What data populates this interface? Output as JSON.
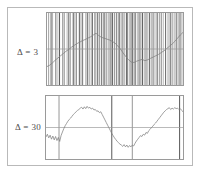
{
  "figure": {
    "title": "",
    "background_color": "#ffffff",
    "frame_color": "#b9b9b9",
    "axis_color": "#9a9a9a"
  },
  "panels": [
    {
      "id": "panel-delta-3",
      "label": "Δ = 3",
      "label_color": "#4c4c4c",
      "spike_color": "#8c8c8c",
      "curve_color": "#8a8a8a",
      "midline_color": "#9a9a9a"
    },
    {
      "id": "panel-delta-30",
      "label": "Δ = 30",
      "label_color": "#4c4c4c",
      "spike_color": "#8c8c8c",
      "curve_color": "#8a8a8a",
      "midline_color": "#9a9a9a"
    }
  ],
  "chart_data": [
    {
      "type": "line",
      "id": "panel-delta-3",
      "title": "Δ = 3",
      "xlabel": "",
      "ylabel": "",
      "xlim": [
        0,
        100
      ],
      "ylim": [
        -1.6,
        1.6
      ],
      "grid": false,
      "legend": "none",
      "midline_y": 0,
      "annotations": [
        "Δ = 3"
      ],
      "series": [
        {
          "name": "smooth-signal",
          "x": [
            0,
            2,
            4,
            6,
            8,
            10,
            12,
            14,
            16,
            18,
            20,
            22,
            24,
            26,
            28,
            30,
            32,
            34,
            36,
            38,
            40,
            42,
            44,
            46,
            48,
            50,
            52,
            54,
            56,
            58,
            60,
            62,
            64,
            66,
            68,
            70,
            72,
            74,
            76,
            78,
            80,
            82,
            84,
            86,
            88,
            90,
            92,
            94,
            96,
            98,
            100
          ],
          "values": [
            -0.78,
            -0.72,
            -0.62,
            -0.5,
            -0.4,
            -0.3,
            -0.2,
            -0.1,
            -0.02,
            0.08,
            0.16,
            0.24,
            0.3,
            0.37,
            0.42,
            0.48,
            0.54,
            0.62,
            0.7,
            0.6,
            0.52,
            0.48,
            0.44,
            0.4,
            0.34,
            0.26,
            0.14,
            0.0,
            -0.18,
            -0.34,
            -0.48,
            -0.58,
            -0.6,
            -0.54,
            -0.5,
            -0.46,
            -0.52,
            -0.48,
            -0.42,
            -0.36,
            -0.3,
            -0.24,
            -0.16,
            -0.08,
            0.02,
            0.12,
            0.22,
            0.34,
            0.48,
            0.62,
            0.74
          ]
        },
        {
          "name": "spike-train",
          "note": "dense vertical impulses spanning full panel height",
          "x": [
            1.2,
            3.0,
            4.1,
            6.5,
            8.0,
            9.2,
            11.4,
            12.6,
            14.8,
            16.0,
            17.1,
            19.3,
            20.5,
            21.6,
            23.8,
            25.0,
            26.2,
            28.4,
            29.6,
            31.0,
            32.5,
            33.4,
            35.2,
            36.0,
            37.3,
            38.6,
            40.0,
            41.2,
            42.0,
            43.5,
            45.0,
            46.4,
            47.5,
            48.2,
            49.6,
            51.0,
            52.3,
            53.1,
            54.5,
            55.8,
            57.0,
            58.4,
            59.2,
            60.5,
            61.8,
            63.0,
            64.2,
            65.0,
            66.4,
            67.7,
            69.0,
            70.2,
            71.5,
            72.8,
            74.0,
            75.3,
            76.6,
            78.0,
            79.4,
            81.0,
            82.6,
            84.0,
            85.5,
            87.2,
            89.0,
            90.6,
            92.0,
            93.5,
            95.0,
            96.4,
            97.8,
            99.2
          ],
          "intensities": [
            0.55,
            0.9,
            0.45,
            0.8,
            0.35,
            0.95,
            0.5,
            0.75,
            0.4,
            0.85,
            0.6,
            0.95,
            0.45,
            0.7,
            0.9,
            0.5,
            0.8,
            0.35,
            0.95,
            0.6,
            0.45,
            0.85,
            0.75,
            0.4,
            0.9,
            0.55,
            0.8,
            0.35,
            0.95,
            0.7,
            0.5,
            0.85,
            0.45,
            0.9,
            0.6,
            0.75,
            0.4,
            0.95,
            0.55,
            0.8,
            0.35,
            0.9,
            0.65,
            0.45,
            0.85,
            0.95,
            0.5,
            0.7,
            0.4,
            0.88,
            0.6,
            0.92,
            0.45,
            0.78,
            0.35,
            0.9,
            0.55,
            0.82,
            0.42,
            0.95,
            0.6,
            0.72,
            0.38,
            0.88,
            0.5,
            0.92,
            0.65,
            0.45,
            0.85,
            0.55,
            0.9,
            0.48
          ]
        }
      ]
    },
    {
      "type": "line",
      "id": "panel-delta-30",
      "title": "Δ = 30",
      "xlabel": "",
      "ylabel": "",
      "xlim": [
        0,
        100
      ],
      "ylim": [
        -1.4,
        1.4
      ],
      "grid": false,
      "legend": "none",
      "midline_y": 0,
      "annotations": [
        "Δ = 30"
      ],
      "series": [
        {
          "name": "noisy-signal",
          "x": [
            0,
            1,
            2,
            3,
            4,
            5,
            6,
            7,
            8,
            9,
            10,
            11,
            12,
            13,
            14,
            15,
            16,
            17,
            18,
            19,
            20,
            21,
            22,
            23,
            24,
            25,
            26,
            27,
            28,
            29,
            30,
            31,
            32,
            33,
            34,
            35,
            36,
            37,
            38,
            39,
            40,
            41,
            42,
            43,
            44,
            45,
            46,
            47,
            48,
            49,
            50,
            51,
            52,
            53,
            54,
            55,
            56,
            57,
            58,
            59,
            60,
            61,
            62,
            63,
            64,
            65,
            66,
            67,
            68,
            69,
            70,
            71,
            72,
            73,
            74,
            75,
            76,
            77,
            78,
            79,
            80,
            81,
            82,
            83,
            84,
            85,
            86,
            87,
            88,
            89,
            90,
            91,
            92,
            93,
            94,
            95,
            96,
            97,
            98,
            99,
            100
          ],
          "values": [
            -0.42,
            -0.3,
            -0.46,
            -0.34,
            -0.52,
            -0.38,
            -0.55,
            -0.4,
            -0.58,
            -0.44,
            -0.62,
            -0.36,
            -0.2,
            -0.05,
            0.08,
            0.18,
            0.28,
            0.36,
            0.42,
            0.5,
            0.58,
            0.64,
            0.7,
            0.76,
            0.8,
            0.86,
            0.9,
            0.82,
            0.92,
            0.84,
            0.94,
            0.86,
            0.9,
            0.82,
            0.86,
            0.78,
            0.8,
            0.72,
            0.74,
            0.66,
            0.7,
            0.58,
            0.46,
            0.34,
            0.22,
            0.1,
            -0.02,
            -0.14,
            -0.26,
            -0.36,
            -0.46,
            -0.54,
            -0.62,
            -0.68,
            -0.74,
            -0.78,
            -0.84,
            -0.76,
            -0.86,
            -0.78,
            -0.88,
            -0.8,
            -0.86,
            -0.78,
            -0.82,
            -0.7,
            -0.6,
            -0.52,
            -0.44,
            -0.36,
            -0.4,
            -0.3,
            -0.34,
            -0.22,
            -0.26,
            -0.14,
            -0.08,
            0.0,
            0.06,
            0.14,
            0.2,
            0.28,
            0.36,
            0.44,
            0.52,
            0.6,
            0.68,
            0.74,
            0.8,
            0.84,
            0.88,
            0.8,
            0.86,
            0.82,
            0.88,
            0.84,
            0.86,
            0.8,
            0.84,
            0.76,
            0.7
          ]
        },
        {
          "name": "spike-train",
          "note": "sparse vertical impulses",
          "x": [
            9.5,
            48.0,
            63.0,
            97.5
          ],
          "intensities": [
            0.62,
            0.95,
            0.62,
            0.95
          ]
        }
      ]
    }
  ]
}
